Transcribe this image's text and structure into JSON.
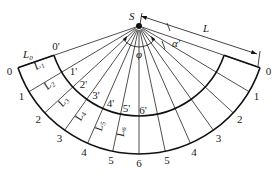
{
  "diagram": {
    "type": "fan-development",
    "apex_label": "S",
    "angle_labels": {
      "fan_angle": "φ",
      "offset_angle": "α'"
    },
    "dimension_label": "L",
    "outer_points": [
      "0",
      "1",
      "2",
      "3",
      "4",
      "5",
      "6",
      "5",
      "4",
      "3",
      "2",
      "1",
      "0"
    ],
    "inner_points": [
      "0'",
      "1'",
      "2'",
      "3'",
      "4'",
      "5'",
      "6'"
    ],
    "segment_labels": [
      {
        "base": "L",
        "sub": "0"
      },
      {
        "base": "L",
        "sub": "1"
      },
      {
        "base": "L",
        "sub": "2"
      },
      {
        "base": "L",
        "sub": "3"
      },
      {
        "base": "L",
        "sub": "4"
      },
      {
        "base": "L",
        "sub": "5"
      },
      {
        "base": "L",
        "sub": "6"
      }
    ]
  }
}
